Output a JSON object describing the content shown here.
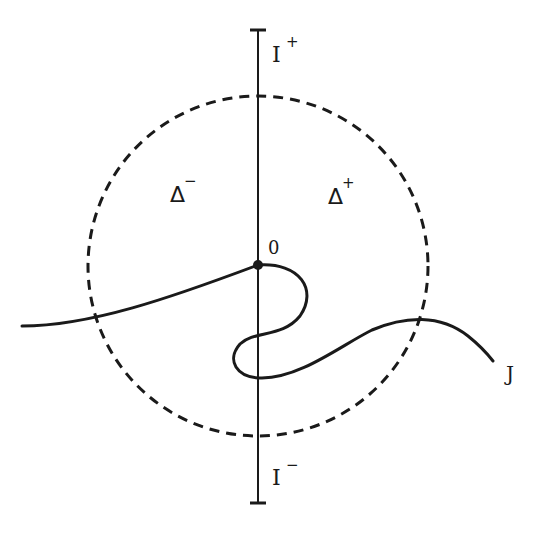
{
  "diagram": {
    "colors": {
      "ink": "#1a1a1a",
      "background": "#ffffff"
    },
    "axis": {
      "top_label": "I",
      "top_sup": "+",
      "bottom_label": "I",
      "bottom_sup": "−"
    },
    "circle": {
      "style": "dashed"
    },
    "regions": {
      "left_label": "Δ",
      "left_sup": "−",
      "right_label": "Δ",
      "right_sup": "+"
    },
    "origin_label": "0",
    "curve_label": "J"
  }
}
